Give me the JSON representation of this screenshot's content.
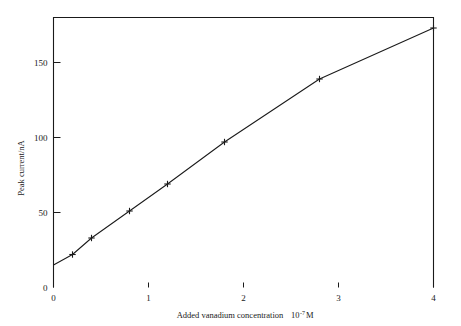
{
  "chart_data": {
    "type": "line",
    "title": "",
    "subtitle": "",
    "xlabel": "Added vanadium concentration  10-7M",
    "xlabel_text": "Added vanadium concentration",
    "xlabel_factor_base": "10",
    "xlabel_factor_exp": "-7",
    "xlabel_factor_unit": "M",
    "ylabel": "Peak current/nA",
    "xlim": [
      0,
      4
    ],
    "ylim": [
      0,
      180
    ],
    "xticks": [
      0,
      1,
      2,
      3,
      4
    ],
    "xtick_labels": [
      "0",
      "1",
      "2",
      "3",
      "4"
    ],
    "yticks": [
      0,
      50,
      100,
      150
    ],
    "ytick_labels": [
      "0",
      "50",
      "100",
      "150"
    ],
    "grid": false,
    "legend": false,
    "legend_position": "none",
    "marker_style": "plus",
    "line_color": "#1a1a1a",
    "series": [
      {
        "name": "Peak current vs added vanadium",
        "x": [
          0,
          0.2,
          0.4,
          0.8,
          1.2,
          1.8,
          2.8,
          4.0
        ],
        "values": [
          15,
          22,
          33,
          51,
          69,
          97,
          139,
          173
        ]
      }
    ]
  },
  "figure": {
    "background_color": "#ffffff",
    "axis_color": "#1a1a1a"
  }
}
